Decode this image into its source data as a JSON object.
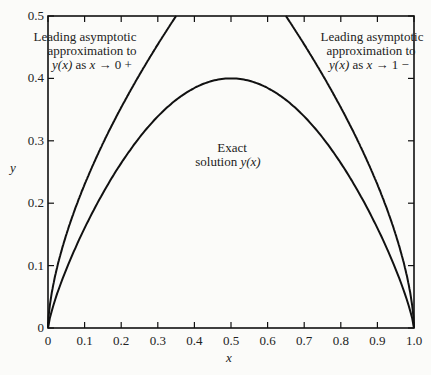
{
  "chart_data": {
    "type": "line",
    "title": "",
    "xlabel": "x",
    "ylabel": "y",
    "xlim": [
      0,
      1.0
    ],
    "ylim": [
      0,
      0.5
    ],
    "x_ticks": [
      "0",
      "0.1",
      "0.2",
      "0.3",
      "0.4",
      "0.5",
      "0.6",
      "0.7",
      "0.8",
      "0.9",
      "1.0"
    ],
    "y_ticks": [
      "0",
      "0.1",
      "0.2",
      "0.3",
      "0.4",
      "0.5"
    ],
    "grid": false,
    "series": [
      {
        "name": "Exact solution y(x)",
        "x": [
          0,
          0.05,
          0.1,
          0.2,
          0.3,
          0.4,
          0.5,
          0.6,
          0.7,
          0.8,
          0.9,
          0.95,
          1.0
        ],
        "values": [
          0,
          0.11,
          0.18,
          0.28,
          0.35,
          0.39,
          0.4,
          0.39,
          0.35,
          0.28,
          0.18,
          0.11,
          0
        ]
      },
      {
        "name": "Leading asymptotic approximation to y(x) as x → 0+",
        "x": [
          0,
          0.05,
          0.1,
          0.15,
          0.2,
          0.25,
          0.3,
          0.35
        ],
        "values": [
          0,
          0.13,
          0.22,
          0.29,
          0.36,
          0.41,
          0.46,
          0.5
        ]
      },
      {
        "name": "Leading asymptotic approximation to y(x) as x → 1−",
        "x": [
          0.65,
          0.7,
          0.75,
          0.8,
          0.85,
          0.9,
          0.95,
          1.0
        ],
        "values": [
          0.5,
          0.46,
          0.41,
          0.36,
          0.29,
          0.22,
          0.13,
          0
        ]
      }
    ],
    "annotations": [
      {
        "lines": [
          "Leading asymptotic",
          "approximation to",
          "y(x) as x → 0 +"
        ]
      },
      {
        "lines": [
          "Exact",
          "solution y(x)"
        ]
      },
      {
        "lines": [
          "Leading asymptotic",
          "approximation to",
          "y(x) as x → 1 −"
        ]
      }
    ]
  },
  "labels": {
    "ann_left_1": "Leading asymptotic",
    "ann_left_2": "approximation to",
    "ann_left_3a": "y(x)",
    "ann_left_3b": " as ",
    "ann_left_3c": "x",
    "ann_left_3d": " → 0 +",
    "ann_mid_1": "Exact",
    "ann_mid_2a": "solution ",
    "ann_mid_2b": "y(x)",
    "ann_right_1": "Leading asymptotic",
    "ann_right_2": "approximation to",
    "ann_right_3a": "y(x)",
    "ann_right_3b": " as ",
    "ann_right_3c": "x",
    "ann_right_3d": " → 1 −",
    "xlabel": "x",
    "ylabel": "y"
  }
}
